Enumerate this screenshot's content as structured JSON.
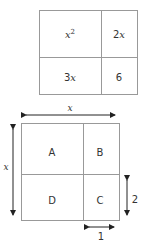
{
  "top_table": {
    "cells": [
      {
        "base": "x",
        "exp": "2"
      },
      {
        "coef": "2",
        "var": "x"
      },
      {
        "coef": "3",
        "var": "x"
      },
      {
        "value": "6"
      }
    ]
  },
  "square": {
    "regions": [
      "A",
      "B",
      "D",
      "C"
    ],
    "top_dimension": "x",
    "left_dimension": "x",
    "right_dimension": "2",
    "bottom_dimension": "1"
  },
  "colors": {
    "line": "#999999",
    "arrow": "#222222",
    "text": "#333333"
  }
}
